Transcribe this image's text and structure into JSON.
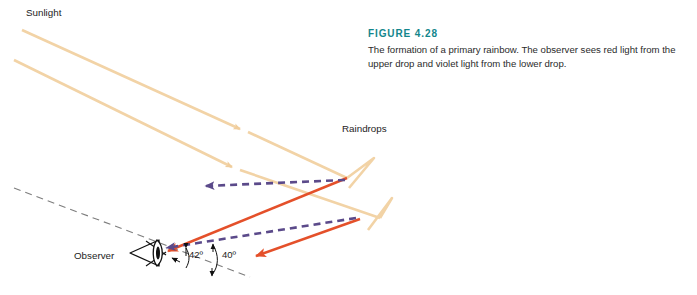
{
  "figure": {
    "caption_label": "FIGURE 4.28",
    "caption_text": "The formation of a primary rainbow. The observer sees red light from the upper drop and violet light from the lower drop.",
    "accent_color": "#13868c"
  },
  "labels": {
    "sunlight": "Sunlight",
    "raindrops": "Raindrops",
    "observer": "Observer",
    "angle_red": "42º",
    "angle_violet": "40º"
  },
  "colors": {
    "sunlight_ray": "#f2d3a6",
    "red_ray": "#e4502a",
    "violet_ray": "#5b4a8a",
    "reference_line": "#7d7d7d",
    "observer_icon": "#111111"
  },
  "diagram": {
    "type": "optics-ray-diagram",
    "sunlight_rays": [
      {
        "name": "upper-sunlight-ray",
        "points": "22,30 347,178"
      },
      {
        "name": "lower-sunlight-ray",
        "points": "14,60 380,218"
      }
    ],
    "raindrop_returns": [
      {
        "name": "upper-drop-return",
        "points": "347,178 372,160 349,186"
      },
      {
        "name": "lower-drop-return",
        "points": "380,218 390,200 368,228"
      }
    ],
    "red_rays": [
      {
        "name": "red-ray-upper-drop",
        "from": "347,178",
        "to": "163,252"
      },
      {
        "name": "red-ray-lower-drop",
        "from": "358,220",
        "to": "250,258"
      }
    ],
    "violet_rays": [
      {
        "name": "violet-ray-upper-drop",
        "from": "345,180",
        "to": "200,186"
      },
      {
        "name": "violet-ray-lower-drop",
        "from": "356,218",
        "to": "160,250"
      }
    ],
    "angles": {
      "red_value": 42,
      "violet_value": 40,
      "vertex": "163,252"
    }
  }
}
